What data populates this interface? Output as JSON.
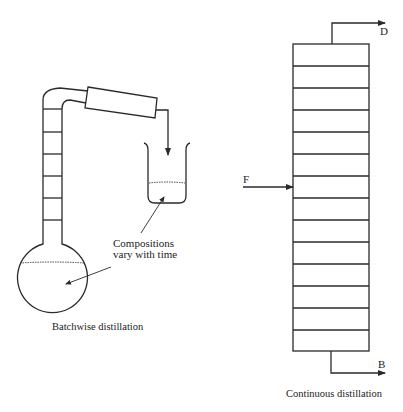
{
  "batch": {
    "caption": "Batchwise distillation",
    "annotation_line1": "Compositions",
    "annotation_line2": "vary with time",
    "column_plates": 6
  },
  "continuous": {
    "caption": "Continuous distillation",
    "feed_label": "F",
    "distillate_label": "D",
    "bottoms_label": "B",
    "column_stages": 14
  },
  "colors": {
    "line": "#2a2a2a",
    "background": "#ffffff"
  }
}
